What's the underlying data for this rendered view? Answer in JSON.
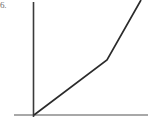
{
  "figure": {
    "label": "6.",
    "background_color": "#ffffff"
  },
  "chart_data": {
    "type": "line",
    "title": "",
    "subtitle": "",
    "xlabel": "",
    "ylabel": "",
    "grid": false,
    "legend": false,
    "legend_position": "none",
    "annotations": [],
    "xticklabels": [],
    "yticklabels": [],
    "axis_style": {
      "y_axis_color": "#3a3a3a",
      "y_axis_width": 1.6,
      "x_axis_color": "#a8a8a8",
      "x_axis_width": 1.8,
      "origin_px": [
        34,
        115
      ],
      "y_axis_top_px": 2,
      "y_axis_bottom_px": 117,
      "x_axis_left_px": 14,
      "x_axis_right_px": 148
    },
    "series": [
      {
        "name": "piecewise-line",
        "color": "#2b2b2b",
        "width": 1.7,
        "points_px": [
          [
            34,
            115
          ],
          [
            107,
            60
          ],
          [
            141,
            0
          ]
        ],
        "x": [
          0,
          1,
          1.47
        ],
        "values": [
          0,
          0.51,
          1.07
        ],
        "description": "Two-segment increasing line from the origin; slope increases after the kink."
      }
    ],
    "xlim": [
      0,
      1.57
    ],
    "ylim": [
      0,
      1.07
    ]
  }
}
